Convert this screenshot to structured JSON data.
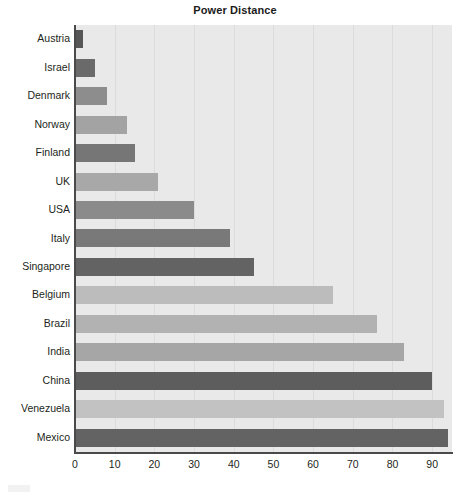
{
  "chart_data": {
    "type": "bar",
    "orientation": "horizontal",
    "title": "Power Distance",
    "xlabel": "",
    "ylabel": "",
    "xlim": [
      0,
      95
    ],
    "ylim": null,
    "grid": true,
    "legend": false,
    "legend_position": "none",
    "xticks": [
      0,
      10,
      20,
      30,
      40,
      50,
      60,
      70,
      80,
      90
    ],
    "xtick_labels": [
      "0",
      "10",
      "20",
      "30",
      "40",
      "50",
      "60",
      "70",
      "80",
      "90"
    ],
    "categories": [
      "Austria",
      "Israel",
      "Denmark",
      "Norway",
      "Finland",
      "UK",
      "USA",
      "Italy",
      "Singapore",
      "Belgium",
      "Brazil",
      "India",
      "China",
      "Venezuela",
      "Mexico"
    ],
    "values": [
      2,
      5,
      8,
      13,
      15,
      21,
      30,
      39,
      45,
      65,
      76,
      83,
      90,
      93,
      94
    ],
    "bar_colors": [
      "#565656",
      "#6a6a6a",
      "#8d8d8d",
      "#a3a3a3",
      "#767676",
      "#a8a8a8",
      "#8b8b8b",
      "#797979",
      "#636363",
      "#bcbcbc",
      "#b2b2b2",
      "#a6a6a6",
      "#5d5d5d",
      "#c2c2c2",
      "#636363"
    ],
    "plot_background": "#e9e9e9",
    "gridline_color": "#dcdcdc",
    "axis_color": "#4a4a4a",
    "text_color": "#231f20"
  }
}
